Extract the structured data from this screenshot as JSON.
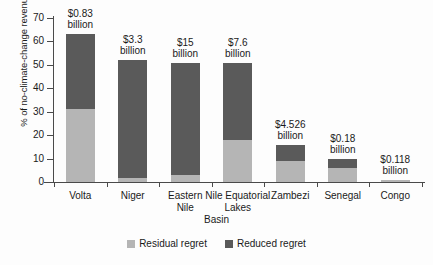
{
  "chart_data": {
    "type": "bar",
    "subtype": "stacked-vertical-bar",
    "title": "",
    "xlabel": "Basin",
    "ylabel": "% of no-climate-change revenues",
    "ylim": [
      0,
      70
    ],
    "yticks": [
      0,
      10,
      20,
      30,
      40,
      50,
      60,
      70
    ],
    "grid": false,
    "legend_position": "bottom-center",
    "categories": [
      "Volta",
      "Niger",
      "Eastern Nile",
      "Nile Equatorial Lakes",
      "Zambezi",
      "Senegal",
      "Congo"
    ],
    "series": [
      {
        "name": "Residual regret",
        "color": "#b5b5b5",
        "values": [
          31,
          1.5,
          3,
          18,
          9,
          6,
          1
        ]
      },
      {
        "name": "Reduced regret",
        "color": "#5a5a5a",
        "values": [
          32,
          50.5,
          48,
          33,
          7,
          4,
          0
        ]
      }
    ],
    "totals": [
      63,
      52,
      51,
      51,
      16,
      10,
      1
    ],
    "annotations": [
      "$0.83 billion",
      "$3.3 billion",
      "$15 billion",
      "$7.6 billion",
      "$4.526 billion",
      "$0.18 billion",
      "$0.118 billion"
    ]
  },
  "axis": {
    "y_title": "% of no-climate-change revenues",
    "x_title": "Basin",
    "y_tick_labels": [
      "0",
      "10",
      "20",
      "30",
      "40",
      "50",
      "60",
      "70"
    ]
  },
  "category_labels": [
    {
      "line1": "Volta",
      "line2": ""
    },
    {
      "line1": "Niger",
      "line2": ""
    },
    {
      "line1": "Eastern",
      "line2": "Nile"
    },
    {
      "line1": "Nile Equatorial",
      "line2": "Lakes"
    },
    {
      "line1": "Zambezi",
      "line2": ""
    },
    {
      "line1": "Senegal",
      "line2": ""
    },
    {
      "line1": "Congo",
      "line2": ""
    }
  ],
  "value_labels": [
    {
      "line1": "$0.83",
      "line2": "billion"
    },
    {
      "line1": "$3.3",
      "line2": "billion"
    },
    {
      "line1": "$15",
      "line2": "billion"
    },
    {
      "line1": "$7.6",
      "line2": "billion"
    },
    {
      "line1": "$4.526",
      "line2": "billion"
    },
    {
      "line1": "$0.18",
      "line2": "billion"
    },
    {
      "line1": "$0.118",
      "line2": "billion"
    }
  ],
  "legend": {
    "items": [
      {
        "label": "Residual regret",
        "color": "#b5b5b5"
      },
      {
        "label": "Reduced regret",
        "color": "#5a5a5a"
      }
    ]
  },
  "colors": {
    "residual": "#b5b5b5",
    "reduced": "#5a5a5a",
    "axis": "#4a4a4a",
    "background": "#fdfdfd"
  }
}
